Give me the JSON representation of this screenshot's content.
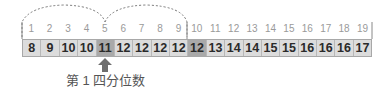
{
  "diagram": {
    "indices": [
      "1",
      "2",
      "3",
      "4",
      "5",
      "6",
      "7",
      "8",
      "9",
      "10",
      "11",
      "12",
      "13",
      "14",
      "15",
      "16",
      "17",
      "18",
      "19"
    ],
    "values": [
      "8",
      "9",
      "10",
      "10",
      "11",
      "12",
      "12",
      "12",
      "12",
      "12",
      "13",
      "14",
      "14",
      "15",
      "15",
      "16",
      "16",
      "16",
      "17"
    ],
    "highlighted_cells": [
      5,
      10
    ],
    "arrow_target_index": 5,
    "label": "第 1 四分位数",
    "colors": {
      "cell": "#dcdcdc",
      "highlight": "#a9a9a9",
      "arrow": "#6e6e6e",
      "index_text": "#9a9a9a"
    }
  }
}
